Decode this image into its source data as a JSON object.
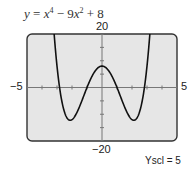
{
  "title": {
    "y": "y",
    "eq": " = ",
    "x1": "x",
    "p1": "4",
    "mid": " − 9",
    "x2": "x",
    "p2": "2",
    "end": " + 8"
  },
  "labels": {
    "ymax": "20",
    "ymin": "−20",
    "xmin": "−5",
    "xmax": "5",
    "yscl": "Yscl = 5"
  },
  "colors": {
    "plot_bg": "#e6e6e6",
    "frame": "#333333",
    "curve": "#111111",
    "axis": "#777777"
  },
  "chart_data": {
    "type": "line",
    "function": "x^4 - 9x^2 + 8",
    "xlim": [
      -5,
      5
    ],
    "ylim": [
      -20,
      20
    ],
    "xscl": 1,
    "yscl": 5,
    "grid": false,
    "series": [
      {
        "name": "y = x^4 − 9x^2 + 8",
        "x": [
          -3.3,
          -3,
          -2.5,
          -2.12,
          -2,
          -1.5,
          -1,
          -0.5,
          0,
          0.5,
          1,
          1.5,
          2,
          2.12,
          2.5,
          3,
          3.3
        ],
        "values": [
          20.6,
          8,
          -8.2,
          -12.25,
          -12,
          -4.2,
          0,
          6,
          8,
          6,
          0,
          -4.2,
          -12,
          -12.25,
          -8.2,
          8,
          20.6
        ]
      }
    ],
    "annotations": [
      "Yscl = 5"
    ]
  }
}
